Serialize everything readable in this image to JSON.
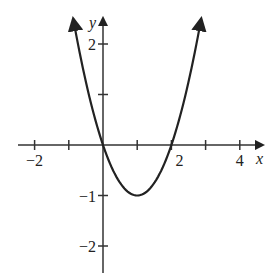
{
  "chart_data": {
    "type": "line",
    "title": "",
    "xlabel": "x",
    "ylabel": "y",
    "function": "y = x^2 - 2x",
    "xlim": [
      -2.3,
      4.6
    ],
    "ylim": [
      -2.5,
      2.6
    ],
    "grid": false,
    "legend": null,
    "x_ticks": [
      -2,
      -1,
      0,
      1,
      2,
      3,
      4
    ],
    "x_tick_labels": [
      {
        "value": -2,
        "label": "−2"
      },
      {
        "value": 2,
        "label": "2"
      },
      {
        "value": 4,
        "label": "4"
      }
    ],
    "y_ticks": [
      -2,
      -1,
      1,
      2
    ],
    "y_tick_labels": [
      {
        "value": 2,
        "label": "2"
      },
      {
        "value": -1,
        "label": "−1"
      },
      {
        "value": -2,
        "label": "−2"
      }
    ],
    "series": [
      {
        "name": "parabola",
        "x": [
          -0.87,
          -0.5,
          0,
          0.5,
          1,
          1.5,
          2,
          2.5,
          2.87
        ],
        "y": [
          2.5,
          1.25,
          0,
          -0.75,
          -1,
          -0.75,
          0,
          1.25,
          2.5
        ],
        "arrows_at_ends": true
      }
    ],
    "key_points": {
      "vertex": [
        1,
        -1
      ],
      "roots": [
        0,
        2
      ]
    }
  },
  "axes": {
    "x_label": "x",
    "y_label": "y"
  },
  "colors": {
    "stroke": "#222222",
    "background": "#ffffff"
  }
}
